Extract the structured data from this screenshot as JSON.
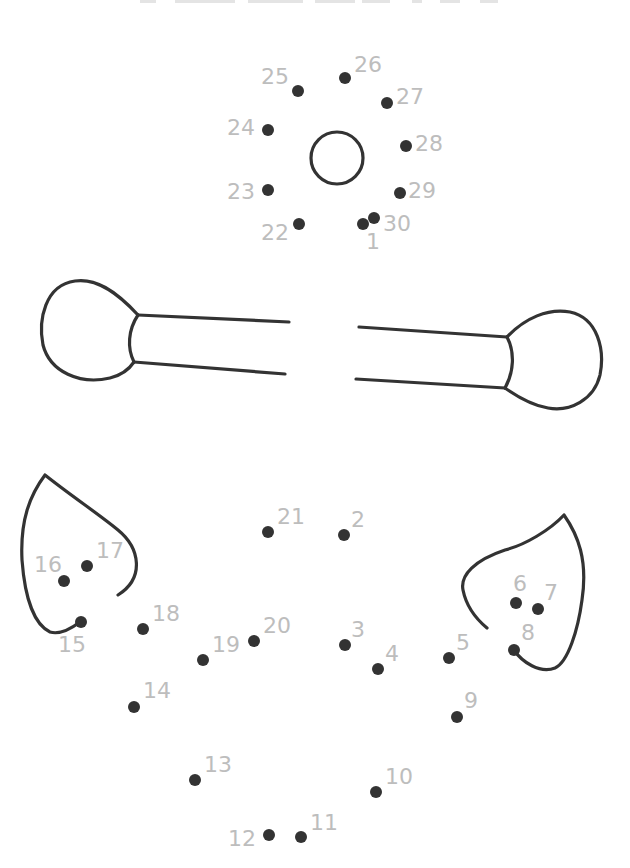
{
  "worksheet": {
    "type": "connect-the-dots",
    "title_visible": false,
    "colors": {
      "dot": "#333333",
      "label": "#bdbdbd",
      "outline": "#333333",
      "background": "#ffffff"
    },
    "dots": [
      {
        "n": "1",
        "x": 363,
        "y": 224,
        "lx": 366,
        "ly": 249
      },
      {
        "n": "2",
        "x": 344,
        "y": 535,
        "lx": 351,
        "ly": 527
      },
      {
        "n": "3",
        "x": 345,
        "y": 645,
        "lx": 351,
        "ly": 637
      },
      {
        "n": "4",
        "x": 378,
        "y": 669,
        "lx": 385,
        "ly": 661
      },
      {
        "n": "5",
        "x": 449,
        "y": 658,
        "lx": 456,
        "ly": 650
      },
      {
        "n": "6",
        "x": 516,
        "y": 603,
        "lx": 513,
        "ly": 591
      },
      {
        "n": "7",
        "x": 538,
        "y": 609,
        "lx": 544,
        "ly": 600
      },
      {
        "n": "8",
        "x": 514,
        "y": 650,
        "lx": 521,
        "ly": 640
      },
      {
        "n": "9",
        "x": 457,
        "y": 717,
        "lx": 464,
        "ly": 708
      },
      {
        "n": "10",
        "x": 376,
        "y": 792,
        "lx": 385,
        "ly": 784
      },
      {
        "n": "11",
        "x": 301,
        "y": 837,
        "lx": 310,
        "ly": 830
      },
      {
        "n": "12",
        "x": 269,
        "y": 835,
        "lx": 228,
        "ly": 846
      },
      {
        "n": "13",
        "x": 195,
        "y": 780,
        "lx": 204,
        "ly": 772
      },
      {
        "n": "14",
        "x": 134,
        "y": 707,
        "lx": 143,
        "ly": 698
      },
      {
        "n": "15",
        "x": 81,
        "y": 622,
        "lx": 58,
        "ly": 652
      },
      {
        "n": "16",
        "x": 64,
        "y": 581,
        "lx": 34,
        "ly": 572
      },
      {
        "n": "17",
        "x": 87,
        "y": 566,
        "lx": 96,
        "ly": 558
      },
      {
        "n": "18",
        "x": 143,
        "y": 629,
        "lx": 152,
        "ly": 621
      },
      {
        "n": "19",
        "x": 203,
        "y": 660,
        "lx": 212,
        "ly": 652
      },
      {
        "n": "20",
        "x": 254,
        "y": 641,
        "lx": 263,
        "ly": 633
      },
      {
        "n": "21",
        "x": 268,
        "y": 532,
        "lx": 277,
        "ly": 524
      },
      {
        "n": "22",
        "x": 299,
        "y": 224,
        "lx": 261,
        "ly": 240
      },
      {
        "n": "23",
        "x": 268,
        "y": 190,
        "lx": 227,
        "ly": 199
      },
      {
        "n": "24",
        "x": 268,
        "y": 130,
        "lx": 227,
        "ly": 135
      },
      {
        "n": "25",
        "x": 298,
        "y": 91,
        "lx": 261,
        "ly": 84
      },
      {
        "n": "26",
        "x": 345,
        "y": 78,
        "lx": 354,
        "ly": 72
      },
      {
        "n": "27",
        "x": 387,
        "y": 103,
        "lx": 396,
        "ly": 104
      },
      {
        "n": "28",
        "x": 406,
        "y": 146,
        "lx": 415,
        "ly": 151
      },
      {
        "n": "29",
        "x": 400,
        "y": 193,
        "lx": 408,
        "ly": 198
      },
      {
        "n": "30",
        "x": 374,
        "y": 218,
        "lx": 383,
        "ly": 231
      }
    ]
  }
}
